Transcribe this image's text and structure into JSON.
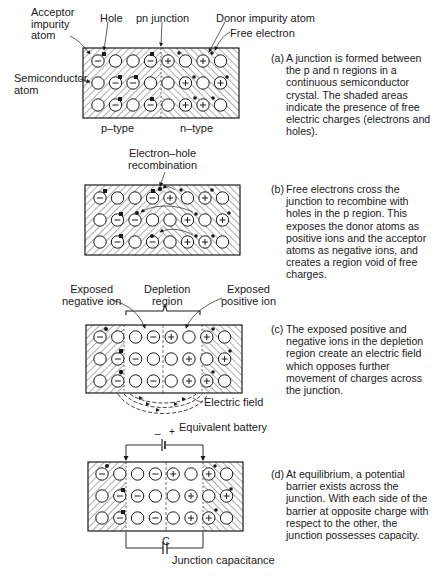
{
  "panels": [
    {
      "id": "a",
      "labels": {
        "acceptor": "Acceptor\nimpurity\natom",
        "hole": "Hole",
        "pn_junction": "pn junction",
        "donor": "Donor impurity atom",
        "free_electron": "Free electron",
        "semiconductor": "Semiconductor\natom",
        "p_type": "p–type",
        "n_type": "n–type"
      },
      "caption_tag": "(a)",
      "caption": "A junction is formed between the p and n regions in a continuous semiconductor crystal. The shaded areas indicate the presence of free electric charges (electrons and holes)."
    },
    {
      "id": "b",
      "labels": {
        "recombination": "Electron–hole\nrecombination"
      },
      "caption_tag": "(b)",
      "caption": "Free electrons cross the junction to recombine with holes in the p region. This exposes the donor atoms as positive ions and the acceptor atoms as negative ions, and creates a region void of free charges."
    },
    {
      "id": "c",
      "labels": {
        "exposed_negative": "Exposed\nnegative ion",
        "depletion": "Depletion\nregion",
        "exposed_positive": "Exposed\npositive ion",
        "electric_field": "Electric field"
      },
      "caption_tag": "(c)",
      "caption": "The exposed positive and negative ions in the depletion region create an electric field which opposes further movement of charges across the junction."
    },
    {
      "id": "d",
      "labels": {
        "battery": "Equivalent battery",
        "battery_minus": "–",
        "battery_plus": "+",
        "cap_symbol": "C",
        "capacitance": "Junction capacitance"
      },
      "caption_tag": "(d)",
      "caption": "At equilibrium, a potential barrier exists across the junction. With each side of the barrier at opposite charge with respect to the other, the junction possesses capacity."
    }
  ],
  "lattice": {
    "rows": 3,
    "cols": 8,
    "ions_a": [
      [
        "-",
        "",
        "",
        "-",
        "+",
        "",
        "+",
        ""
      ],
      [
        "",
        "-",
        "-",
        "",
        "",
        "+",
        "",
        "+"
      ],
      [
        "",
        "-",
        "",
        "-",
        "",
        "+",
        "+",
        ""
      ]
    ],
    "ions_bcd": [
      [
        "-",
        "",
        "",
        "-",
        "+",
        "",
        "+",
        ""
      ],
      [
        "",
        "-",
        "-",
        "",
        "",
        "+",
        "",
        "+"
      ],
      [
        "",
        "-",
        "",
        "-",
        "",
        "+",
        "+",
        ""
      ]
    ]
  },
  "colors": {
    "ink": "#1a1a1a",
    "paper": "#ffffff"
  }
}
